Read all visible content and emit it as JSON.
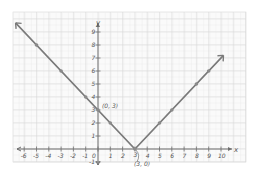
{
  "chart_data": {
    "type": "line",
    "title": "",
    "function": "y = |x - 3|",
    "xlabel": "x",
    "ylabel": "y",
    "xlim": [
      -6,
      10
    ],
    "ylim": [
      -1,
      9
    ],
    "grid": true,
    "x_ticks": [
      -6,
      -5,
      -4,
      -3,
      -2,
      -1,
      0,
      1,
      2,
      3,
      4,
      5,
      6,
      7,
      8,
      9,
      10
    ],
    "y_ticks": [
      -1,
      1,
      2,
      3,
      4,
      5,
      6,
      7,
      8,
      9
    ],
    "series": [
      {
        "name": "y = |x - 3|",
        "color": "#7a7a7a",
        "points": [
          {
            "x": -5,
            "y": 8
          },
          {
            "x": -3,
            "y": 6
          },
          {
            "x": -1,
            "y": 4
          },
          {
            "x": 0,
            "y": 3
          },
          {
            "x": 1,
            "y": 2
          },
          {
            "x": 3,
            "y": 0
          },
          {
            "x": 5,
            "y": 2
          },
          {
            "x": 6,
            "y": 3
          },
          {
            "x": 8,
            "y": 5
          },
          {
            "x": 9,
            "y": 6
          }
        ]
      }
    ],
    "annotations": [
      {
        "text": "(0, 3)",
        "x": 0,
        "y": 3
      },
      {
        "text": "(3, 0)",
        "x": 3,
        "y": 0
      }
    ]
  },
  "labels": {
    "x_axis": "x",
    "y_axis": "y",
    "y_intercept": "(0, 3)",
    "vertex": "(3, 0)"
  }
}
